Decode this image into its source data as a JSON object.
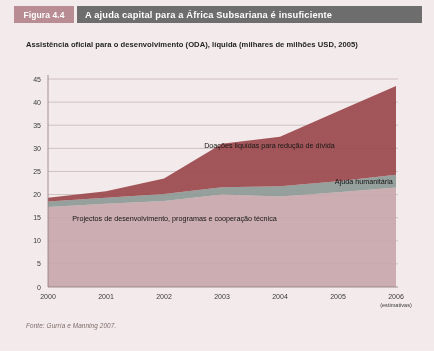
{
  "figure": {
    "tag": "Figura 4.4",
    "title": "A ajuda capital para a África Subsariana é insuficiente",
    "subtitle": "Assistência oficial para o desenvolvimento (ODA), líquida (milhares de milhões USD, 2005)",
    "source": "Fonte: Gurría e Manning 2007.",
    "tag_bg": "#b98d93",
    "title_bg": "#6e6e6e",
    "card_bg": "#f4ecec"
  },
  "chart_data": {
    "type": "area",
    "title": "A ajuda capital para a África Subsariana é insuficiente",
    "subtitle": "Assistência oficial para o desenvolvimento (ODA), líquida (milhares de milhões USD, 2005)",
    "xlabel": "",
    "ylabel": "",
    "categories": [
      "2000",
      "2001",
      "2002",
      "2003",
      "2004",
      "2005",
      "2006"
    ],
    "x_tick_sublabels": [
      "",
      "",
      "",
      "",
      "",
      "",
      "(estimativas)"
    ],
    "ylim": [
      0,
      45
    ],
    "y_ticks": [
      0,
      5,
      10,
      15,
      20,
      25,
      30,
      35,
      40,
      45
    ],
    "grid": true,
    "legend_position": "inline-annotations",
    "stacked": true,
    "series": [
      {
        "name": "Projectos de desenvolvimento, programas e cooperação técnica",
        "color": "#c9a9ad",
        "values": [
          17.3,
          18.0,
          18.6,
          20.0,
          19.6,
          20.5,
          21.5
        ]
      },
      {
        "name": "Ajuda humanitária",
        "color": "#8e9a96",
        "values": [
          1.2,
          1.3,
          1.5,
          1.6,
          2.2,
          2.4,
          2.8
        ]
      },
      {
        "name": "Doações líquidas para redução de dívida",
        "color": "#9c4a4f",
        "values": [
          0.8,
          1.4,
          3.4,
          9.4,
          10.7,
          15.1,
          19.2
        ]
      }
    ],
    "totals": [
      19.3,
      20.7,
      23.5,
      31.0,
      32.5,
      38.0,
      43.5
    ],
    "annotations": [
      {
        "text": "Doações líquidas para redução de dívida",
        "x": 2003.6,
        "y": 30.0
      },
      {
        "text": "Ajuda humanitária",
        "x": 2004.6,
        "y": 22.3
      },
      {
        "text": "Projectos de desenvolvimento, programas e cooperação técnica",
        "x": 2002.6,
        "y": 14.2
      }
    ]
  }
}
